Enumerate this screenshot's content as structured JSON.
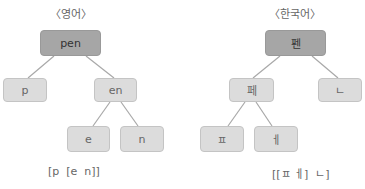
{
  "english": {
    "title": "〈영어〉",
    "nodes": {
      "root": "pen",
      "left": "p",
      "right": "en",
      "right_left": "e",
      "right_right": "n"
    },
    "bracket": "[p  [e  n]]"
  },
  "korean": {
    "title": "〈한국어〉",
    "nodes": {
      "root": "펜",
      "left": "페",
      "right": "ㄴ",
      "left_left": "ㅍ",
      "left_right": "ㅔ"
    },
    "bracket": "[[ㅍ ㅔ]  ㄴ]"
  },
  "colors": {
    "root_fill": "#a6a6a6",
    "node_fill": "#dcdcdc",
    "edge": "#a8a8a8"
  }
}
